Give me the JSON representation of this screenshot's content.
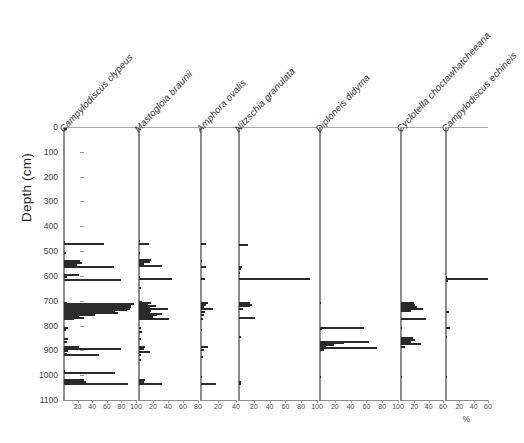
{
  "chart_data": {
    "type": "bar",
    "orientation": "horizontal-stratigraphic",
    "title": "",
    "subtitle": "",
    "xlabel": "%",
    "ylabel": "Depth (cm)",
    "ylim": [
      0,
      1100
    ],
    "y_inverted": true,
    "ytick_labels": [
      "0",
      "100",
      "200",
      "300",
      "400",
      "500",
      "600",
      "700",
      "800",
      "900",
      "1000",
      "1100"
    ],
    "ytick_values": [
      0,
      100,
      200,
      300,
      400,
      500,
      600,
      700,
      800,
      900,
      1000,
      1100
    ],
    "grid": false,
    "legend": "none",
    "accent_color": "#2a2a2a",
    "axis_color": "#8c8c8c",
    "panels": [
      {
        "name": "Campylodiscus clypeus",
        "xlim": [
          0,
          100
        ],
        "xticks": [
          20,
          40,
          60,
          80,
          100
        ],
        "xtick_labels": [
          "20",
          "40",
          "60",
          "80",
          "100"
        ],
        "points": [
          {
            "depth": 2,
            "value": 4
          },
          {
            "depth": 455,
            "value": 2
          },
          {
            "depth": 465,
            "value": 55
          },
          {
            "depth": 500,
            "value": 3
          },
          {
            "depth": 530,
            "value": 22
          },
          {
            "depth": 540,
            "value": 25
          },
          {
            "depth": 548,
            "value": 18
          },
          {
            "depth": 556,
            "value": 69
          },
          {
            "depth": 590,
            "value": 20
          },
          {
            "depth": 598,
            "value": 4
          },
          {
            "depth": 608,
            "value": 78
          },
          {
            "depth": 700,
            "value": 4
          },
          {
            "depth": 706,
            "value": 96
          },
          {
            "depth": 712,
            "value": 92
          },
          {
            "depth": 718,
            "value": 92
          },
          {
            "depth": 724,
            "value": 90
          },
          {
            "depth": 730,
            "value": 86
          },
          {
            "depth": 736,
            "value": 70
          },
          {
            "depth": 742,
            "value": 74
          },
          {
            "depth": 748,
            "value": 42
          },
          {
            "depth": 754,
            "value": 20
          },
          {
            "depth": 760,
            "value": 28
          },
          {
            "depth": 766,
            "value": 14
          },
          {
            "depth": 800,
            "value": 5
          },
          {
            "depth": 808,
            "value": 3
          },
          {
            "depth": 848,
            "value": 6
          },
          {
            "depth": 858,
            "value": 4
          },
          {
            "depth": 878,
            "value": 20
          },
          {
            "depth": 886,
            "value": 78
          },
          {
            "depth": 896,
            "value": 6
          },
          {
            "depth": 906,
            "value": 4
          },
          {
            "depth": 912,
            "value": 48
          },
          {
            "depth": 975,
            "value": 2
          },
          {
            "depth": 985,
            "value": 70
          },
          {
            "depth": 1010,
            "value": 28
          },
          {
            "depth": 1018,
            "value": 30
          },
          {
            "depth": 1026,
            "value": 88
          }
        ]
      },
      {
        "name": "Mastogloia braunii",
        "xlim": [
          0,
          80
        ],
        "xticks": [
          20,
          40,
          60,
          80
        ],
        "xtick_labels": [
          "20",
          "40",
          "60",
          "80"
        ],
        "points": [
          {
            "depth": 452,
            "value": 1
          },
          {
            "depth": 462,
            "value": 13
          },
          {
            "depth": 500,
            "value": 1
          },
          {
            "depth": 528,
            "value": 16
          },
          {
            "depth": 536,
            "value": 15
          },
          {
            "depth": 544,
            "value": 6
          },
          {
            "depth": 552,
            "value": 30
          },
          {
            "depth": 596,
            "value": 1
          },
          {
            "depth": 606,
            "value": 44
          },
          {
            "depth": 640,
            "value": 3
          },
          {
            "depth": 696,
            "value": 4
          },
          {
            "depth": 702,
            "value": 16
          },
          {
            "depth": 708,
            "value": 12
          },
          {
            "depth": 714,
            "value": 22
          },
          {
            "depth": 720,
            "value": 14
          },
          {
            "depth": 726,
            "value": 38
          },
          {
            "depth": 732,
            "value": 16
          },
          {
            "depth": 738,
            "value": 14
          },
          {
            "depth": 744,
            "value": 30
          },
          {
            "depth": 750,
            "value": 24
          },
          {
            "depth": 758,
            "value": 18
          },
          {
            "depth": 766,
            "value": 40
          },
          {
            "depth": 800,
            "value": 3
          },
          {
            "depth": 816,
            "value": 4
          },
          {
            "depth": 848,
            "value": 2
          },
          {
            "depth": 878,
            "value": 8
          },
          {
            "depth": 888,
            "value": 6
          },
          {
            "depth": 898,
            "value": 15
          },
          {
            "depth": 912,
            "value": 3
          },
          {
            "depth": 930,
            "value": 2
          },
          {
            "depth": 1010,
            "value": 8
          },
          {
            "depth": 1018,
            "value": 6
          },
          {
            "depth": 1026,
            "value": 30
          }
        ]
      },
      {
        "name": "Amphora ovalis",
        "xlim": [
          0,
          40
        ],
        "xticks": [
          20,
          40
        ],
        "xtick_labels": [
          "20",
          "40"
        ],
        "points": [
          {
            "depth": 462,
            "value": 5
          },
          {
            "depth": 530,
            "value": 1
          },
          {
            "depth": 556,
            "value": 6
          },
          {
            "depth": 606,
            "value": 4
          },
          {
            "depth": 700,
            "value": 8
          },
          {
            "depth": 708,
            "value": 5
          },
          {
            "depth": 716,
            "value": 3
          },
          {
            "depth": 724,
            "value": 13
          },
          {
            "depth": 736,
            "value": 4
          },
          {
            "depth": 748,
            "value": 3
          },
          {
            "depth": 766,
            "value": 2
          },
          {
            "depth": 810,
            "value": 1
          },
          {
            "depth": 878,
            "value": 8
          },
          {
            "depth": 890,
            "value": 3
          },
          {
            "depth": 918,
            "value": 2
          },
          {
            "depth": 1000,
            "value": 1
          },
          {
            "depth": 1026,
            "value": 17
          }
        ]
      },
      {
        "name": "Nitzschia granulata",
        "xlim": [
          0,
          100
        ],
        "xticks": [
          20,
          40,
          60,
          80,
          100
        ],
        "xtick_labels": [
          "20",
          "40",
          "60",
          "80",
          "100"
        ],
        "points": [
          {
            "depth": 466,
            "value": 12
          },
          {
            "depth": 556,
            "value": 4
          },
          {
            "depth": 566,
            "value": 2
          },
          {
            "depth": 580,
            "value": 1
          },
          {
            "depth": 606,
            "value": 90
          },
          {
            "depth": 700,
            "value": 14
          },
          {
            "depth": 708,
            "value": 16
          },
          {
            "depth": 714,
            "value": 14
          },
          {
            "depth": 726,
            "value": 5
          },
          {
            "depth": 762,
            "value": 20
          },
          {
            "depth": 840,
            "value": 2
          },
          {
            "depth": 1020,
            "value": 2
          },
          {
            "depth": 1028,
            "value": 3
          }
        ]
      },
      {
        "name": "Diploneis didyma",
        "xlim": [
          0,
          100
        ],
        "xticks": [
          20,
          40,
          60,
          80,
          100
        ],
        "xtick_labels": [
          "20",
          "40",
          "60",
          "80",
          "100"
        ],
        "points": [
          {
            "depth": 700,
            "value": 1
          },
          {
            "depth": 800,
            "value": 56
          },
          {
            "depth": 806,
            "value": 3
          },
          {
            "depth": 858,
            "value": 62
          },
          {
            "depth": 864,
            "value": 30
          },
          {
            "depth": 870,
            "value": 18
          },
          {
            "depth": 876,
            "value": 8
          },
          {
            "depth": 882,
            "value": 72
          },
          {
            "depth": 890,
            "value": 5
          },
          {
            "depth": 1000,
            "value": 1
          }
        ]
      },
      {
        "name": "Cyclotella choctawhatcheeana",
        "xlim": [
          0,
          60
        ],
        "xticks": [
          20,
          40,
          60
        ],
        "xtick_labels": [
          "20",
          "40",
          "60"
        ],
        "points": [
          {
            "depth": 700,
            "value": 18
          },
          {
            "depth": 708,
            "value": 20
          },
          {
            "depth": 716,
            "value": 22
          },
          {
            "depth": 724,
            "value": 30
          },
          {
            "depth": 732,
            "value": 14
          },
          {
            "depth": 766,
            "value": 35
          },
          {
            "depth": 800,
            "value": 2
          },
          {
            "depth": 842,
            "value": 17
          },
          {
            "depth": 850,
            "value": 19
          },
          {
            "depth": 858,
            "value": 14
          },
          {
            "depth": 868,
            "value": 28
          },
          {
            "depth": 878,
            "value": 5
          },
          {
            "depth": 1000,
            "value": 1
          }
        ]
      },
      {
        "name": "Campylodiscus echineis",
        "xlim": [
          0,
          60
        ],
        "xticks": [
          20,
          40,
          60
        ],
        "xtick_labels": [
          "20",
          "40",
          "60"
        ],
        "points": [
          {
            "depth": 596,
            "value": 2
          },
          {
            "depth": 604,
            "value": 58
          },
          {
            "depth": 612,
            "value": 3
          },
          {
            "depth": 736,
            "value": 4
          },
          {
            "depth": 800,
            "value": 6
          },
          {
            "depth": 840,
            "value": 2
          },
          {
            "depth": 1000,
            "value": 1
          }
        ]
      }
    ]
  }
}
